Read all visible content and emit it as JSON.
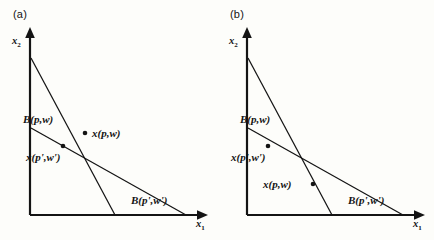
{
  "figure": {
    "background_color": "#fdfdfa",
    "ink_color": "#141414",
    "width": 434,
    "height": 240
  },
  "panels": [
    {
      "id": "a",
      "tag": "(a)",
      "axes": {
        "y_label_base": "x",
        "y_label_sub": "2",
        "x_label_base": "x",
        "x_label_sub": "1"
      },
      "lines": [
        {
          "name": "budget-line-original",
          "label": "B(p,w)",
          "y_intercept_label_pos": "upper-left",
          "slope_description": "steep"
        },
        {
          "name": "budget-line-primed",
          "label": "B(p',w')",
          "y_intercept_label_pos": "lower-right",
          "slope_description": "flat"
        }
      ],
      "bundles": [
        {
          "name": "bundle-original",
          "label": "x(p,w)",
          "on_line": "budget-line-original"
        },
        {
          "name": "bundle-primed",
          "label": "x(p',w')",
          "on_line": "budget-line-primed"
        }
      ]
    },
    {
      "id": "b",
      "tag": "(b)",
      "axes": {
        "y_label_base": "x",
        "y_label_sub": "2",
        "x_label_base": "x",
        "x_label_sub": "1"
      },
      "lines": [
        {
          "name": "budget-line-original",
          "label": "B(p,w)",
          "y_intercept_label_pos": "upper-left",
          "slope_description": "steep"
        },
        {
          "name": "budget-line-primed",
          "label": "B(p',w')",
          "y_intercept_label_pos": "lower-right",
          "slope_description": "flat"
        }
      ],
      "bundles": [
        {
          "name": "bundle-original",
          "label": "x(p,w)",
          "on_line": "budget-line-original"
        },
        {
          "name": "bundle-primed",
          "label": "x(p',w')",
          "on_line": "budget-line-primed"
        }
      ]
    }
  ]
}
